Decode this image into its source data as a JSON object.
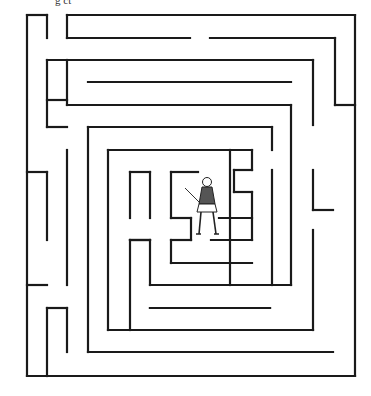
{
  "caption": "g  ct",
  "maze": {
    "stroke": "#1a1a1a",
    "stroke_width": 2.2,
    "segments": [
      [
        27,
        15,
        47,
        15
      ],
      [
        47,
        15,
        47,
        38
      ],
      [
        27,
        15,
        27,
        376
      ],
      [
        67,
        15,
        355,
        15
      ],
      [
        67,
        15,
        67,
        38
      ],
      [
        67,
        38,
        190,
        38
      ],
      [
        210,
        38,
        335,
        38
      ],
      [
        335,
        38,
        335,
        105
      ],
      [
        335,
        105,
        355,
        105
      ],
      [
        355,
        15,
        355,
        376
      ],
      [
        47,
        60,
        313,
        60
      ],
      [
        313,
        60,
        313,
        125
      ],
      [
        47,
        60,
        47,
        127
      ],
      [
        47,
        127,
        67,
        127
      ],
      [
        47,
        100,
        67,
        100
      ],
      [
        88,
        82,
        291,
        82
      ],
      [
        67,
        60,
        67,
        105
      ],
      [
        67,
        105,
        291,
        105
      ],
      [
        291,
        105,
        291,
        285
      ],
      [
        88,
        127,
        272,
        127
      ],
      [
        88,
        127,
        88,
        352
      ],
      [
        272,
        127,
        272,
        150
      ],
      [
        108,
        150,
        252,
        150
      ],
      [
        108,
        150,
        108,
        330
      ],
      [
        252,
        150,
        252,
        170
      ],
      [
        234,
        170,
        252,
        170
      ],
      [
        234,
        170,
        234,
        192
      ],
      [
        234,
        192,
        252,
        192
      ],
      [
        252,
        192,
        252,
        240
      ],
      [
        130,
        172,
        150,
        172
      ],
      [
        130,
        172,
        130,
        218
      ],
      [
        150,
        172,
        150,
        218
      ],
      [
        130,
        240,
        150,
        240
      ],
      [
        130,
        240,
        150,
        240
      ],
      [
        130,
        240,
        130,
        330
      ],
      [
        150,
        240,
        150,
        285
      ],
      [
        150,
        285,
        291,
        285
      ],
      [
        150,
        308,
        270,
        308
      ],
      [
        171,
        172,
        198,
        172
      ],
      [
        171,
        172,
        171,
        218
      ],
      [
        171,
        218,
        191,
        218
      ],
      [
        191,
        218,
        191,
        240
      ],
      [
        171,
        240,
        191,
        240
      ],
      [
        171,
        240,
        171,
        263
      ],
      [
        171,
        263,
        252,
        263
      ],
      [
        211,
        240,
        252,
        240
      ],
      [
        219,
        218,
        252,
        218
      ],
      [
        272,
        170,
        272,
        285
      ],
      [
        313,
        170,
        313,
        210
      ],
      [
        313,
        210,
        333,
        210
      ],
      [
        313,
        230,
        313,
        330
      ],
      [
        230,
        285,
        230,
        150
      ],
      [
        27,
        172,
        47,
        172
      ],
      [
        47,
        172,
        47,
        240
      ],
      [
        67,
        150,
        67,
        285
      ],
      [
        27,
        285,
        47,
        285
      ],
      [
        47,
        308,
        67,
        308
      ],
      [
        47,
        308,
        47,
        376
      ],
      [
        67,
        308,
        67,
        352
      ],
      [
        88,
        352,
        333,
        352
      ],
      [
        27,
        376,
        355,
        376
      ],
      [
        108,
        330,
        313,
        330
      ],
      [
        150,
        308,
        270,
        308
      ]
    ]
  },
  "character": {
    "name": "knight-with-sword",
    "x": 195,
    "y": 178
  }
}
